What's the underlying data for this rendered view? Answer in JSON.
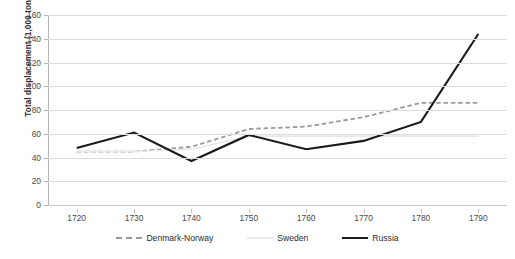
{
  "chart_data": {
    "type": "line",
    "title": "",
    "xlabel": "..",
    "ylabel": "Total displacement (1,000 tons)",
    "categories": [
      "1720",
      "1730",
      "1740",
      "1750",
      "1760",
      "1770",
      "1780",
      "1790"
    ],
    "x": [
      1720,
      1730,
      1740,
      1750,
      1760,
      1770,
      1780,
      1790
    ],
    "xlim": [
      1715,
      1795
    ],
    "ylim": [
      0,
      160
    ],
    "ytick_labels": [
      "0",
      "20",
      "40",
      "60",
      "80",
      "100",
      "120",
      "140",
      "160"
    ],
    "ytick_values": [
      0,
      20,
      40,
      60,
      80,
      100,
      120,
      140,
      160
    ],
    "grid": true,
    "legend_position": "bottom",
    "series": [
      {
        "name": "Denmark-Norway",
        "style": "dashed",
        "color": "#9a9a9a",
        "values": [
          45,
          45,
          49,
          64,
          66,
          74,
          86,
          86
        ]
      },
      {
        "name": "Sweden",
        "style": "solid",
        "color": "#e8e8e8",
        "values": [
          45,
          45,
          47,
          58,
          58,
          58,
          58,
          58
        ]
      },
      {
        "name": "Russia",
        "style": "solid",
        "color": "#1a1a1a",
        "values": [
          48,
          61,
          37,
          59,
          47,
          54,
          70,
          144
        ]
      }
    ]
  },
  "legend": {
    "items": [
      {
        "label": "Denmark-Norway"
      },
      {
        "label": "Sweden"
      },
      {
        "label": "Russia"
      }
    ]
  }
}
